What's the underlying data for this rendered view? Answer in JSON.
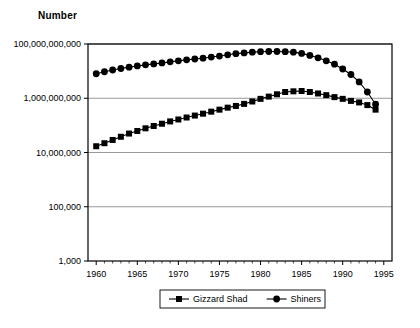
{
  "chart_data": {
    "type": "line",
    "title": "",
    "ylabel": "Number",
    "xlabel": "",
    "scale": "log",
    "grid": true,
    "legend_position": "bottom",
    "xlim": [
      1959,
      1996
    ],
    "ylim": [
      1000,
      100000000000
    ],
    "x_ticks": [
      "1960",
      "1965",
      "1970",
      "1975",
      "1980",
      "1985",
      "1990",
      "1995"
    ],
    "x_tick_values": [
      1960,
      1965,
      1970,
      1975,
      1980,
      1985,
      1990,
      1995
    ],
    "y_ticks": [
      "1,000",
      "100,000",
      "10,000,000",
      "1,000,000,000",
      "100,000,000,000"
    ],
    "y_tick_values": [
      1000,
      100000,
      10000000,
      1000000000,
      100000000000
    ],
    "x": [
      1960,
      1961,
      1962,
      1963,
      1964,
      1965,
      1966,
      1967,
      1968,
      1969,
      1970,
      1971,
      1972,
      1973,
      1974,
      1975,
      1976,
      1977,
      1978,
      1979,
      1980,
      1981,
      1982,
      1983,
      1984,
      1985,
      1986,
      1987,
      1988,
      1989,
      1990,
      1991,
      1992,
      1993,
      1994
    ],
    "series": [
      {
        "name": "Gizzard Shad",
        "marker": "square",
        "values": [
          17000000,
          22000000,
          29000000,
          38000000,
          50000000,
          62000000,
          78000000,
          95000000,
          115000000,
          140000000,
          165000000,
          195000000,
          230000000,
          270000000,
          320000000,
          380000000,
          450000000,
          520000000,
          620000000,
          760000000,
          950000000,
          1150000000,
          1400000000,
          1700000000,
          1800000000,
          1850000000,
          1700000000,
          1500000000,
          1300000000,
          1100000000,
          950000000,
          800000000,
          700000000,
          560000000,
          380000000
        ]
      },
      {
        "name": "Shiners",
        "marker": "circle",
        "values": [
          8000000000,
          9500000000,
          11000000000,
          12500000000,
          14000000000,
          15500000000,
          17000000000,
          18500000000,
          20000000000,
          22000000000,
          24000000000,
          26000000000,
          28000000000,
          30000000000,
          33000000000,
          36000000000,
          40000000000,
          44000000000,
          47000000000,
          50000000000,
          52000000000,
          53000000000,
          53000000000,
          52000000000,
          50000000000,
          45000000000,
          38000000000,
          31000000000,
          24000000000,
          18000000000,
          12000000000,
          7500000000,
          4000000000,
          1700000000,
          600000000
        ]
      }
    ]
  }
}
